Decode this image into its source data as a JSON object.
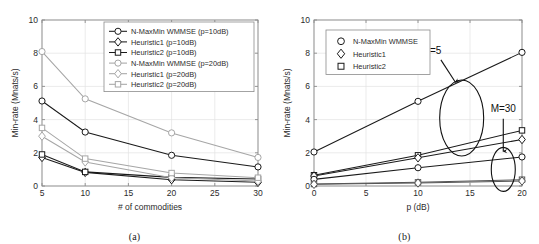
{
  "figure": {
    "panels": [
      {
        "id": "a",
        "caption": "(a)",
        "legend_position": "top-right-inside"
      },
      {
        "id": "b",
        "caption": "(b)",
        "legend_position": "top-left-inside"
      }
    ]
  },
  "chart_data": [
    {
      "type": "line",
      "panel": "a",
      "title": "",
      "xlabel": "# of commodities",
      "ylabel": "Min-rate (Mnats/s)",
      "xlim": [
        5,
        30
      ],
      "ylim": [
        0,
        10
      ],
      "xticks": [
        5,
        10,
        15,
        20,
        25,
        30
      ],
      "yticks": [
        0,
        2,
        4,
        6,
        8,
        10
      ],
      "grid": true,
      "x": [
        5,
        10,
        20,
        30
      ],
      "series": [
        {
          "name": "N-MaxMin WMMSE (p=10dB)",
          "marker": "circle",
          "color": "#1a1a1a",
          "values": [
            5.12,
            3.25,
            1.85,
            1.15
          ]
        },
        {
          "name": "Heuristic1 (p=10dB)",
          "marker": "diamond",
          "color": "#1a1a1a",
          "values": [
            1.72,
            0.82,
            0.38,
            0.22
          ]
        },
        {
          "name": "Heuristic2 (p=10dB)",
          "marker": "square",
          "color": "#1a1a1a",
          "values": [
            1.9,
            0.85,
            0.52,
            0.42
          ]
        },
        {
          "name": "N-MaxMin WMMSE (p=20dB)",
          "marker": "circle",
          "color": "#a6a6a6",
          "values": [
            8.1,
            5.25,
            3.2,
            1.72
          ]
        },
        {
          "name": "Heuristic1 (p=20dB)",
          "marker": "diamond",
          "color": "#a6a6a6",
          "values": [
            3.0,
            1.45,
            0.5,
            0.3
          ]
        },
        {
          "name": "Heuristic2 (p=20dB)",
          "marker": "square",
          "color": "#a6a6a6",
          "values": [
            3.5,
            1.65,
            0.78,
            0.5
          ]
        }
      ]
    },
    {
      "type": "line",
      "panel": "b",
      "title": "",
      "xlabel": "p (dB)",
      "ylabel": "Min-rate (Mnats/s)",
      "xlim": [
        0,
        20
      ],
      "ylim": [
        0,
        10
      ],
      "xticks": [
        0,
        5,
        10,
        15,
        20
      ],
      "yticks": [
        0,
        2,
        4,
        6,
        8,
        10
      ],
      "grid": true,
      "x": [
        0,
        10,
        20
      ],
      "annotations": [
        {
          "text": "M=5",
          "group": "M=5"
        },
        {
          "text": "M=30",
          "group": "M=30"
        }
      ],
      "legend": [
        {
          "name": "N-MaxMin WMMSE",
          "marker": "circle"
        },
        {
          "name": "Heuristic1",
          "marker": "diamond"
        },
        {
          "name": "Heuristic2",
          "marker": "square"
        }
      ],
      "series": [
        {
          "name": "N-MaxMin WMMSE (M=5)",
          "marker": "circle",
          "group": "M=5",
          "color": "#1a1a1a",
          "values": [
            2.05,
            5.1,
            8.05
          ]
        },
        {
          "name": "Heuristic2 (M=5)",
          "marker": "square",
          "group": "M=5",
          "color": "#1a1a1a",
          "values": [
            0.65,
            1.85,
            3.35
          ]
        },
        {
          "name": "Heuristic1 (M=5)",
          "marker": "diamond",
          "group": "M=5",
          "color": "#1a1a1a",
          "values": [
            0.6,
            1.7,
            2.8
          ]
        },
        {
          "name": "N-MaxMin WMMSE (M=30)",
          "marker": "circle",
          "group": "M=30",
          "color": "#1a1a1a",
          "values": [
            0.4,
            1.1,
            1.75
          ]
        },
        {
          "name": "Heuristic2 (M=30)",
          "marker": "square",
          "group": "M=30",
          "color": "#555555",
          "values": [
            0.12,
            0.22,
            0.38
          ]
        },
        {
          "name": "Heuristic1 (M=30)",
          "marker": "diamond",
          "group": "M=30",
          "color": "#555555",
          "values": [
            0.1,
            0.18,
            0.3
          ]
        }
      ]
    }
  ]
}
